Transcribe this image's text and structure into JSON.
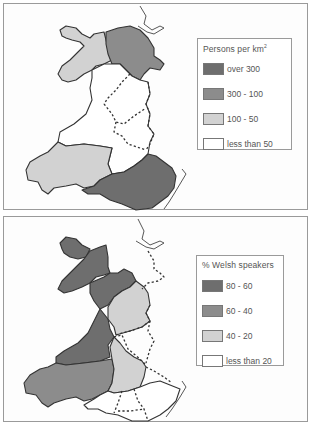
{
  "maps": [
    {
      "id": "population-density",
      "legend": {
        "title": "Persons per km",
        "title_superscript": "2",
        "items": [
          {
            "label": "over 300",
            "color": "#6e6e6e"
          },
          {
            "label": "300 - 100",
            "color": "#8c8c8c"
          },
          {
            "label": "100 - 50",
            "color": "#d2d2d2"
          },
          {
            "label": "less than 50",
            "color": "#ffffff"
          }
        ]
      },
      "regions": [
        {
          "name": "Anglesey and Caernarvonshire",
          "class": "100 - 50",
          "color": "#d2d2d2"
        },
        {
          "name": "Denbighshire and Flintshire",
          "class": "300 - 100",
          "color": "#8c8c8c"
        },
        {
          "name": "Mid Wales",
          "class": "less than 50",
          "color": "#ffffff"
        },
        {
          "name": "Dyfed (Carmarthen / Pembroke)",
          "class": "100 - 50",
          "color": "#d2d2d2"
        },
        {
          "name": "South East Wales (Glamorgan / Gwent)",
          "class": "over 300",
          "color": "#6e6e6e"
        }
      ]
    },
    {
      "id": "welsh-speakers",
      "legend": {
        "title": "% Welsh speakers",
        "items": [
          {
            "label": "80 - 60",
            "color": "#6e6e6e"
          },
          {
            "label": "60 - 40",
            "color": "#8c8c8c"
          },
          {
            "label": "40 - 20",
            "color": "#d2d2d2"
          },
          {
            "label": "less than 20",
            "color": "#ffffff"
          }
        ]
      },
      "regions": [
        {
          "name": "Anglesey",
          "class": "80 - 60",
          "color": "#6e6e6e"
        },
        {
          "name": "Caernarvonshire",
          "class": "80 - 60",
          "color": "#6e6e6e"
        },
        {
          "name": "Merioneth",
          "class": "80 - 60",
          "color": "#6e6e6e"
        },
        {
          "name": "Cardiganshire",
          "class": "80 - 60",
          "color": "#6e6e6e"
        },
        {
          "name": "Carmarthen / Pembroke",
          "class": "60 - 40",
          "color": "#8c8c8c"
        },
        {
          "name": "Denbigh / Montgomery",
          "class": "40 - 20",
          "color": "#d2d2d2"
        },
        {
          "name": "Radnor / Brecon",
          "class": "40 - 20",
          "color": "#d2d2d2"
        },
        {
          "name": "South East Wales",
          "class": "less than 20",
          "color": "#ffffff"
        }
      ]
    }
  ]
}
